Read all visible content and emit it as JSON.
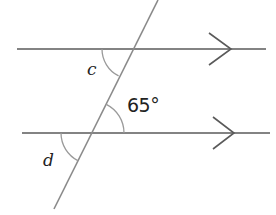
{
  "diagram": {
    "type": "parallel-lines-transversal",
    "colors": {
      "background": "#ffffff",
      "parallel_line": "#5a5a5a",
      "transversal": "#8a8a8a",
      "arc": "#9a9a9a",
      "label": "#222222"
    },
    "parallel_lines": [
      {
        "name": "top",
        "x1": 17,
        "y1": 49,
        "x2": 266,
        "y2": 49,
        "arrow_tip": [
          231,
          49
        ]
      },
      {
        "name": "bottom",
        "x1": 22,
        "y1": 133,
        "x2": 270,
        "y2": 133,
        "arrow_tip": [
          234,
          133
        ]
      }
    ],
    "transversal": {
      "x1": 158,
      "y1": 0,
      "x2": 54,
      "y2": 209
    },
    "angles": [
      {
        "label": "c",
        "vertex": [
          132,
          49
        ],
        "position": "below-left of top intersection"
      },
      {
        "label": "65°",
        "vertex": [
          92,
          133
        ],
        "position": "above-right of bottom intersection"
      },
      {
        "label": "d",
        "vertex": [
          92,
          133
        ],
        "position": "below-left of bottom intersection"
      }
    ]
  },
  "labels": {
    "angle_c": "c",
    "angle_65": "65°",
    "angle_d": "d"
  }
}
